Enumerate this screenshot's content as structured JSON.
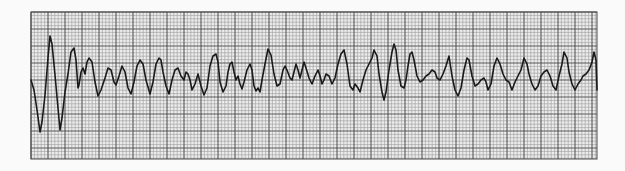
{
  "strip": {
    "type": "ecg-rhythm-strip",
    "rhythm_appearance": "chaotic irregular waveform (ventricular fibrillation pattern)",
    "grid": {
      "left": 31,
      "top": 12,
      "right": 597,
      "bottom": 159,
      "minor_px": 3.4,
      "major_every": 5,
      "paper_color": "#ececec",
      "minor_color": "#9a9a9a",
      "major_color": "#4a4a4a"
    },
    "trace": {
      "color": "#1a1a1a",
      "width": 1.6,
      "points": [
        [
          31,
          80
        ],
        [
          34,
          90
        ],
        [
          37,
          110
        ],
        [
          40,
          132
        ],
        [
          42,
          122
        ],
        [
          45,
          95
        ],
        [
          48,
          58
        ],
        [
          50,
          36
        ],
        [
          52,
          44
        ],
        [
          55,
          75
        ],
        [
          58,
          108
        ],
        [
          60,
          130
        ],
        [
          62,
          118
        ],
        [
          65,
          92
        ],
        [
          68,
          74
        ],
        [
          71,
          52
        ],
        [
          74,
          48
        ],
        [
          76,
          60
        ],
        [
          78,
          88
        ],
        [
          79,
          85
        ],
        [
          81,
          72
        ],
        [
          83,
          68
        ],
        [
          85,
          74
        ],
        [
          87,
          62
        ],
        [
          89,
          58
        ],
        [
          92,
          62
        ],
        [
          95,
          82
        ],
        [
          98,
          96
        ],
        [
          101,
          90
        ],
        [
          105,
          78
        ],
        [
          108,
          68
        ],
        [
          111,
          70
        ],
        [
          114,
          82
        ],
        [
          116,
          85
        ],
        [
          119,
          76
        ],
        [
          122,
          66
        ],
        [
          125,
          72
        ],
        [
          128,
          88
        ],
        [
          131,
          94
        ],
        [
          134,
          82
        ],
        [
          137,
          66
        ],
        [
          140,
          60
        ],
        [
          143,
          64
        ],
        [
          146,
          80
        ],
        [
          150,
          94
        ],
        [
          153,
          82
        ],
        [
          156,
          64
        ],
        [
          159,
          58
        ],
        [
          161,
          60
        ],
        [
          163,
          72
        ],
        [
          166,
          86
        ],
        [
          169,
          94
        ],
        [
          172,
          80
        ],
        [
          175,
          70
        ],
        [
          178,
          68
        ],
        [
          181,
          76
        ],
        [
          184,
          80
        ],
        [
          186,
          72
        ],
        [
          188,
          74
        ],
        [
          190,
          80
        ],
        [
          192,
          90
        ],
        [
          195,
          84
        ],
        [
          198,
          74
        ],
        [
          201,
          86
        ],
        [
          204,
          95
        ],
        [
          207,
          88
        ],
        [
          210,
          66
        ],
        [
          213,
          56
        ],
        [
          216,
          54
        ],
        [
          218,
          62
        ],
        [
          220,
          82
        ],
        [
          223,
          92
        ],
        [
          226,
          86
        ],
        [
          228,
          72
        ],
        [
          230,
          64
        ],
        [
          232,
          62
        ],
        [
          234,
          72
        ],
        [
          236,
          80
        ],
        [
          238,
          76
        ],
        [
          240,
          84
        ],
        [
          242,
          89
        ],
        [
          244,
          82
        ],
        [
          247,
          70
        ],
        [
          250,
          64
        ],
        [
          252,
          70
        ],
        [
          254,
          86
        ],
        [
          256,
          91
        ],
        [
          258,
          88
        ],
        [
          260,
          92
        ],
        [
          262,
          80
        ],
        [
          265,
          64
        ],
        [
          268,
          49
        ],
        [
          271,
          55
        ],
        [
          274,
          74
        ],
        [
          277,
          86
        ],
        [
          280,
          84
        ],
        [
          283,
          70
        ],
        [
          285,
          66
        ],
        [
          287,
          70
        ],
        [
          290,
          78
        ],
        [
          292,
          80
        ],
        [
          294,
          72
        ],
        [
          296,
          64
        ],
        [
          298,
          70
        ],
        [
          300,
          78
        ],
        [
          302,
          70
        ],
        [
          304,
          62
        ],
        [
          306,
          68
        ],
        [
          309,
          78
        ],
        [
          312,
          84
        ],
        [
          315,
          76
        ],
        [
          318,
          70
        ],
        [
          320,
          76
        ],
        [
          322,
          84
        ],
        [
          324,
          80
        ],
        [
          326,
          74
        ],
        [
          329,
          76
        ],
        [
          332,
          84
        ],
        [
          335,
          78
        ],
        [
          338,
          64
        ],
        [
          341,
          54
        ],
        [
          344,
          50
        ],
        [
          347,
          64
        ],
        [
          350,
          86
        ],
        [
          353,
          90
        ],
        [
          355,
          84
        ],
        [
          358,
          88
        ],
        [
          360,
          92
        ],
        [
          363,
          80
        ],
        [
          366,
          70
        ],
        [
          369,
          64
        ],
        [
          372,
          58
        ],
        [
          374,
          50
        ],
        [
          377,
          56
        ],
        [
          379,
          74
        ],
        [
          382,
          92
        ],
        [
          384,
          100
        ],
        [
          386,
          92
        ],
        [
          389,
          70
        ],
        [
          392,
          52
        ],
        [
          394,
          44
        ],
        [
          396,
          50
        ],
        [
          398,
          70
        ],
        [
          401,
          86
        ],
        [
          404,
          88
        ],
        [
          406,
          80
        ],
        [
          408,
          66
        ],
        [
          410,
          54
        ],
        [
          412,
          52
        ],
        [
          414,
          60
        ],
        [
          417,
          76
        ],
        [
          420,
          82
        ],
        [
          423,
          80
        ],
        [
          426,
          76
        ],
        [
          429,
          74
        ],
        [
          432,
          70
        ],
        [
          435,
          72
        ],
        [
          437,
          78
        ],
        [
          440,
          80
        ],
        [
          443,
          74
        ],
        [
          446,
          66
        ],
        [
          449,
          56
        ],
        [
          452,
          76
        ],
        [
          455,
          90
        ],
        [
          458,
          96
        ],
        [
          461,
          88
        ],
        [
          464,
          70
        ],
        [
          467,
          58
        ],
        [
          469,
          60
        ],
        [
          472,
          76
        ],
        [
          475,
          86
        ],
        [
          478,
          84
        ],
        [
          481,
          80
        ],
        [
          484,
          78
        ],
        [
          486,
          82
        ],
        [
          488,
          90
        ],
        [
          491,
          84
        ],
        [
          494,
          66
        ],
        [
          497,
          58
        ],
        [
          500,
          64
        ],
        [
          503,
          74
        ],
        [
          506,
          80
        ],
        [
          509,
          82
        ],
        [
          512,
          90
        ],
        [
          515,
          82
        ],
        [
          518,
          76
        ],
        [
          521,
          70
        ],
        [
          524,
          58
        ],
        [
          527,
          64
        ],
        [
          529,
          74
        ],
        [
          532,
          84
        ],
        [
          535,
          90
        ],
        [
          538,
          86
        ],
        [
          541,
          76
        ],
        [
          544,
          72
        ],
        [
          547,
          70
        ],
        [
          550,
          76
        ],
        [
          553,
          86
        ],
        [
          556,
          90
        ],
        [
          559,
          76
        ],
        [
          562,
          64
        ],
        [
          564,
          52
        ],
        [
          567,
          58
        ],
        [
          569,
          72
        ],
        [
          572,
          84
        ],
        [
          575,
          90
        ],
        [
          578,
          84
        ],
        [
          581,
          80
        ],
        [
          583,
          76
        ],
        [
          586,
          74
        ],
        [
          589,
          70
        ],
        [
          592,
          62
        ],
        [
          594,
          52
        ],
        [
          596,
          60
        ],
        [
          597,
          90
        ]
      ]
    }
  }
}
